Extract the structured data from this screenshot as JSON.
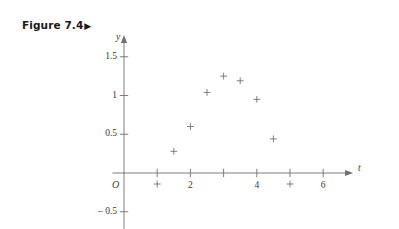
{
  "figure": {
    "caption": "Figure 7.4",
    "caption_arrow": "▶"
  },
  "chart_data": {
    "type": "scatter",
    "title": "",
    "xlabel": "t",
    "ylabel": "y",
    "xlim": [
      -0.35,
      6.9
    ],
    "ylim": [
      -0.72,
      1.78
    ],
    "grid": false,
    "legend": null,
    "marker": "plus",
    "marker_color": "#6b6b6b",
    "axis_color": "#707070",
    "origin_label": "O",
    "xticks": [
      1,
      2,
      3,
      4,
      5,
      6
    ],
    "xtick_labels": [
      "",
      "2",
      "",
      "4",
      "",
      "6"
    ],
    "yticks": [
      -0.5,
      0.5,
      1,
      1.5
    ],
    "ytick_labels": [
      "– 0.5",
      "0.5",
      "1",
      "1.5"
    ],
    "x": [
      1,
      1.5,
      2,
      2.5,
      3,
      3.5,
      4,
      4.5,
      5
    ],
    "y": [
      0,
      0.28,
      0.6,
      1.04,
      1.25,
      1.19,
      0.95,
      0.44,
      0
    ],
    "points": [
      {
        "t": 1,
        "y": 0
      },
      {
        "t": 1.5,
        "y": 0.28
      },
      {
        "t": 2,
        "y": 0.6
      },
      {
        "t": 2.5,
        "y": 1.04
      },
      {
        "t": 3,
        "y": 1.25
      },
      {
        "t": 3.5,
        "y": 1.19
      },
      {
        "t": 4,
        "y": 0.95
      },
      {
        "t": 4.5,
        "y": 0.44
      },
      {
        "t": 5,
        "y": 0
      }
    ]
  }
}
